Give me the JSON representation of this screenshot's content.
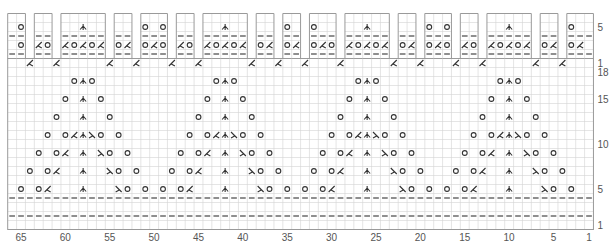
{
  "chart_title": "Lace knitting chart with scalloped border",
  "colors": {
    "grid_minor": "#d4d4d4",
    "grid_major": "#a8a8a8",
    "border": "#9a9a9a",
    "symbol": "#333333",
    "label": "#555555",
    "background": "#ffffff"
  },
  "legend_symbols": {
    "O": "yarn over",
    "/": "k2tog (left-leaning ⋌ shown as /)",
    "\\": "ssk (λ)",
    "A": "central double decrease (⋏)",
    "-": "purl"
  },
  "grid": {
    "total_columns": 66,
    "col_width_px": 8.875,
    "row_height_px": 9,
    "left_px": 7.7,
    "top_px": 13.5
  },
  "column_labels": [
    "65",
    "60",
    "55",
    "50",
    "45",
    "40",
    "35",
    "30",
    "25",
    "20",
    "15",
    "10",
    "5",
    "1"
  ],
  "column_label_values": [
    65,
    60,
    55,
    50,
    45,
    40,
    35,
    30,
    25,
    20,
    15,
    10,
    5,
    1
  ],
  "border_chart": {
    "row_labels": [
      {
        "row": 5,
        "text": "5"
      },
      {
        "row": 1,
        "text": "1"
      }
    ],
    "rows_total": 6,
    "tabs": [
      {
        "cols": [
          66,
          65
        ],
        "row5": {
          "65": "O"
        },
        "row3": {
          "65": "O"
        }
      },
      {
        "cols": [
          63,
          62
        ],
        "row5": {},
        "row3": {
          "63": "/",
          "62": "O"
        }
      },
      {
        "cols": [
          60,
          59,
          58,
          57,
          56
        ],
        "row5": {
          "58": "A"
        },
        "row3": {
          "60": "/",
          "59": "O",
          "58": "/",
          "57": "O",
          "56": "/"
        }
      },
      {
        "cols": [
          54,
          53
        ],
        "row5": {},
        "row3": {
          "54": "O",
          "53": "/"
        }
      },
      {
        "cols": [
          51,
          50,
          49
        ],
        "row5": {
          "51": "O",
          "49": "O"
        },
        "row3": {
          "51": "O",
          "50": "/",
          "49": "O"
        }
      },
      {
        "cols": [
          47,
          46
        ],
        "row5": {},
        "row3": {
          "47": "/",
          "46": "O"
        }
      },
      {
        "cols": [
          44,
          43,
          42,
          41,
          40
        ],
        "row5": {
          "42": "A"
        },
        "row3": {
          "44": "/",
          "43": "O",
          "42": "/",
          "41": "O",
          "40": "/"
        }
      },
      {
        "cols": [
          38,
          37
        ],
        "row5": {},
        "row3": {
          "38": "O",
          "37": "/"
        }
      },
      {
        "cols": [
          35,
          34
        ],
        "row5": {
          "35": "O"
        },
        "row3": {
          "35": "O",
          "34": "/"
        }
      },
      {
        "cols": [
          32,
          31,
          30
        ],
        "row5": {
          "32": "O"
        },
        "row3": {
          "32": "O",
          "31": "/",
          "30": "O"
        }
      },
      {
        "cols": [
          28,
          27,
          26,
          25,
          24
        ],
        "row5": {
          "26": "A"
        },
        "row3": {
          "28": "/",
          "27": "O",
          "26": "/",
          "25": "O",
          "24": "/"
        }
      },
      {
        "cols": [
          22,
          21
        ],
        "row5": {},
        "row3": {
          "22": "O",
          "21": "/"
        }
      },
      {
        "cols": [
          19,
          18,
          17
        ],
        "row5": {
          "19": "O",
          "17": "O"
        },
        "row3": {
          "19": "O",
          "18": "/",
          "17": "O"
        }
      },
      {
        "cols": [
          15,
          14
        ],
        "row5": {},
        "row3": {
          "15": "/",
          "14": "O"
        }
      },
      {
        "cols": [
          12,
          11,
          10,
          9,
          8
        ],
        "row5": {
          "10": "A"
        },
        "row3": {
          "12": "/",
          "11": "O",
          "10": "/",
          "9": "O",
          "8": "/"
        }
      },
      {
        "cols": [
          6,
          5
        ],
        "row5": {},
        "row3": {
          "6": "O",
          "5": "/"
        }
      },
      {
        "cols": [
          3,
          2,
          1
        ],
        "row5": {
          "3": "O"
        },
        "row3": {
          "3": "O",
          "2": "/"
        }
      }
    ],
    "row1_decrease_cols": [
      64,
      61,
      55,
      52,
      48,
      45,
      39,
      36,
      33,
      29,
      23,
      20,
      16,
      13,
      7,
      4
    ]
  },
  "main_chart": {
    "rows_total": 18,
    "row_labels": [
      {
        "row": 18,
        "text": "18"
      },
      {
        "row": 15,
        "text": "15"
      },
      {
        "row": 10,
        "text": "10"
      },
      {
        "row": 5,
        "text": "5"
      },
      {
        "row": 1,
        "text": "1"
      }
    ],
    "purl_rows": [
      2,
      4
    ],
    "motif_centers": [
      58,
      42,
      26,
      10
    ],
    "motif_rows": {
      "17": {
        "-1": "O",
        "0": "A",
        "1": "O"
      },
      "15": {
        "-2": "O",
        "0": "A",
        "2": "O"
      },
      "13": {
        "-3": "O",
        "0": "A",
        "3": "O"
      },
      "11": {
        "-4": "O",
        "-2": "O",
        "-1": "/",
        "0": "A",
        "1": "\\",
        "2": "O",
        "4": "O"
      },
      "9": {
        "-5": "O",
        "-3": "O",
        "-2": "/",
        "0": "A",
        "2": "\\",
        "3": "O",
        "5": "O"
      },
      "7": {
        "-6": "O",
        "-4": "O",
        "-3": "/",
        "0": "A",
        "3": "\\",
        "4": "O",
        "6": "O"
      },
      "5": {
        "-7": "O",
        "-5": "O",
        "-4": "/",
        "0": "A",
        "4": "\\",
        "5": "O",
        "7": "O"
      }
    }
  }
}
